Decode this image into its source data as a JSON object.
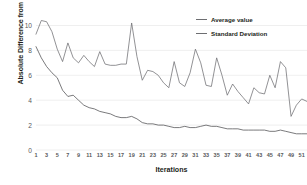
{
  "chart_data": {
    "type": "line",
    "title": "",
    "xlabel": "Iterations",
    "ylabel": "Absolute Difference from Difficulty Goal",
    "xlim": [
      1,
      52
    ],
    "ylim": [
      0,
      10.6
    ],
    "yticks": [
      0,
      2,
      4,
      6,
      8,
      10
    ],
    "ytick_labels": [
      "0",
      "2",
      "4",
      "6",
      "8",
      "10"
    ],
    "xticks": [
      1,
      3,
      5,
      7,
      9,
      11,
      13,
      15,
      17,
      19,
      21,
      23,
      25,
      27,
      29,
      31,
      33,
      35,
      37,
      39,
      41,
      43,
      45,
      47,
      49,
      51
    ],
    "xtick_labels": [
      "1",
      "3",
      "5",
      "7",
      "9",
      "11",
      "13",
      "15",
      "17",
      "19",
      "21",
      "23",
      "25",
      "27",
      "29",
      "31",
      "33",
      "35",
      "37",
      "39",
      "41",
      "43",
      "45",
      "47",
      "49",
      "51"
    ],
    "grid": true,
    "grid_axis": "y",
    "legend_position": "top-right",
    "line_color": "#6d6e71",
    "grid_color": "#e8e8e8",
    "x": [
      1,
      2,
      3,
      4,
      5,
      6,
      7,
      8,
      9,
      10,
      11,
      12,
      13,
      14,
      15,
      16,
      17,
      18,
      19,
      20,
      21,
      22,
      23,
      24,
      25,
      26,
      27,
      28,
      29,
      30,
      31,
      32,
      33,
      34,
      35,
      36,
      37,
      38,
      39,
      40,
      41,
      42,
      43,
      44,
      45,
      46,
      47,
      48,
      49,
      50,
      51,
      52
    ],
    "series": [
      {
        "name": "Average value",
        "values": [
          9.3,
          10.4,
          10.3,
          9.5,
          8.1,
          7.1,
          8.6,
          7.4,
          7.0,
          7.6,
          7.1,
          6.7,
          7.9,
          6.9,
          6.8,
          6.8,
          6.9,
          6.9,
          10.2,
          7.5,
          5.6,
          6.4,
          6.3,
          6.0,
          5.4,
          5.0,
          7.1,
          5.4,
          5.1,
          6.2,
          8.1,
          7.0,
          5.2,
          5.1,
          7.4,
          6.0,
          4.4,
          5.3,
          4.7,
          4.2,
          3.7,
          5.0,
          4.6,
          4.5,
          6.0,
          5.0,
          7.1,
          6.6,
          2.7,
          3.6,
          4.1,
          3.9
        ]
      },
      {
        "name": "Standard Deviation",
        "values": [
          8.3,
          7.4,
          6.7,
          6.2,
          5.8,
          4.8,
          4.3,
          4.4,
          4.0,
          3.6,
          3.4,
          3.3,
          3.1,
          3.0,
          2.9,
          2.7,
          2.6,
          2.6,
          2.7,
          2.5,
          2.2,
          2.1,
          2.1,
          2.0,
          2.0,
          1.9,
          1.8,
          1.8,
          1.9,
          1.8,
          1.8,
          1.9,
          2.0,
          1.9,
          1.9,
          1.8,
          1.7,
          1.7,
          1.7,
          1.6,
          1.6,
          1.6,
          1.6,
          1.6,
          1.5,
          1.5,
          1.6,
          1.5,
          1.4,
          1.3,
          1.3,
          1.3
        ]
      }
    ],
    "legend": [
      {
        "label": "Average value",
        "color": "#6d6e71"
      },
      {
        "label": "Standard Deviation",
        "color": "#4d4e50"
      }
    ]
  }
}
